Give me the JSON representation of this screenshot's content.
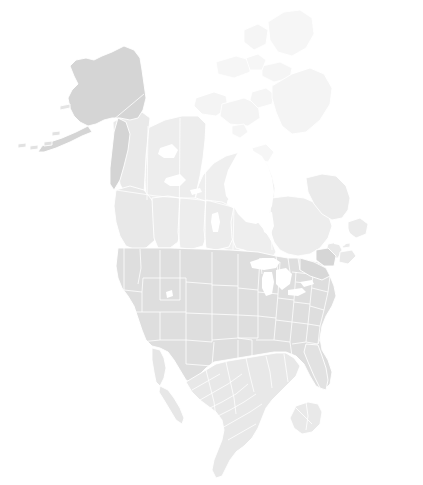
{
  "map": {
    "title": "North America",
    "projection": "albers-north-america",
    "background_color": "#ffffff",
    "border_color": "#ffffff",
    "water_color": "#ffffff",
    "width": 423,
    "height": 485,
    "legend_visible": false,
    "labels_visible": false,
    "countries": [
      {
        "name": "Canada",
        "fill": "#ececec",
        "subdivision_level": "province",
        "subdivisions": [
          {
            "name": "Yukon",
            "fill": "#e9e9e9"
          },
          {
            "name": "Northwest Territories",
            "fill": "#ededed"
          },
          {
            "name": "Nunavut",
            "fill": "#efefef"
          },
          {
            "name": "British Columbia",
            "fill": "#e8e8e8"
          },
          {
            "name": "Alberta",
            "fill": "#ebebeb"
          },
          {
            "name": "Saskatchewan",
            "fill": "#ededed"
          },
          {
            "name": "Manitoba",
            "fill": "#ececec"
          },
          {
            "name": "Ontario",
            "fill": "#eeeeee"
          },
          {
            "name": "Quebec",
            "fill": "#ededed"
          },
          {
            "name": "Newfoundland and Labrador",
            "fill": "#ebebeb"
          },
          {
            "name": "New Brunswick",
            "fill": "#e9e9e9"
          },
          {
            "name": "Nova Scotia",
            "fill": "#e9e9e9"
          },
          {
            "name": "Prince Edward Island",
            "fill": "#eaeaea"
          }
        ]
      },
      {
        "name": "United States",
        "fill": "#e3e3e3",
        "subdivision_level": "state",
        "subdivisions": [
          {
            "name": "Alaska",
            "fill": "#d5d5d5"
          },
          {
            "name": "Washington",
            "fill": "#dddddd"
          },
          {
            "name": "Oregon",
            "fill": "#dedede"
          },
          {
            "name": "California",
            "fill": "#dfdfdf"
          },
          {
            "name": "Idaho",
            "fill": "#dcdcdc"
          },
          {
            "name": "Nevada",
            "fill": "#e0e0e0"
          },
          {
            "name": "Montana",
            "fill": "#dbdbdb"
          },
          {
            "name": "Wyoming",
            "fill": "#dddddd"
          },
          {
            "name": "Utah",
            "fill": "#e0e0e0"
          },
          {
            "name": "Arizona",
            "fill": "#e1e1e1"
          },
          {
            "name": "Colorado",
            "fill": "#dedede"
          },
          {
            "name": "New Mexico",
            "fill": "#e1e1e1"
          },
          {
            "name": "North Dakota",
            "fill": "#dadada"
          },
          {
            "name": "South Dakota",
            "fill": "#dcdcdc"
          },
          {
            "name": "Nebraska",
            "fill": "#dedede"
          },
          {
            "name": "Kansas",
            "fill": "#e0e0e0"
          },
          {
            "name": "Oklahoma",
            "fill": "#e1e1e1"
          },
          {
            "name": "Texas",
            "fill": "#e2e2e2"
          },
          {
            "name": "Minnesota",
            "fill": "#dcdcdc"
          },
          {
            "name": "Iowa",
            "fill": "#dedede"
          },
          {
            "name": "Missouri",
            "fill": "#e0e0e0"
          },
          {
            "name": "Arkansas",
            "fill": "#e2e2e2"
          },
          {
            "name": "Louisiana",
            "fill": "#e3e3e3"
          },
          {
            "name": "Wisconsin",
            "fill": "#dcdcdc"
          },
          {
            "name": "Illinois",
            "fill": "#dfdfdf"
          },
          {
            "name": "Michigan",
            "fill": "#dbdbdb"
          },
          {
            "name": "Indiana",
            "fill": "#dedede"
          },
          {
            "name": "Ohio",
            "fill": "#dddddd"
          },
          {
            "name": "Kentucky",
            "fill": "#e0e0e0"
          },
          {
            "name": "Tennessee",
            "fill": "#e1e1e1"
          },
          {
            "name": "Mississippi",
            "fill": "#e3e3e3"
          },
          {
            "name": "Alabama",
            "fill": "#e2e2e2"
          },
          {
            "name": "Georgia",
            "fill": "#e1e1e1"
          },
          {
            "name": "Florida",
            "fill": "#e2e2e2"
          },
          {
            "name": "South Carolina",
            "fill": "#e0e0e0"
          },
          {
            "name": "North Carolina",
            "fill": "#dedede"
          },
          {
            "name": "Virginia",
            "fill": "#dcdcdc"
          },
          {
            "name": "West Virginia",
            "fill": "#dddddd"
          },
          {
            "name": "Pennsylvania",
            "fill": "#d9d9d9"
          },
          {
            "name": "New York",
            "fill": "#d7d7d7"
          },
          {
            "name": "Vermont",
            "fill": "#d8d8d8"
          },
          {
            "name": "New Hampshire",
            "fill": "#d8d8d8"
          },
          {
            "name": "Maine",
            "fill": "#d6d6d6"
          },
          {
            "name": "Massachusetts",
            "fill": "#d7d7d7"
          },
          {
            "name": "Connecticut",
            "fill": "#d8d8d8"
          },
          {
            "name": "Rhode Island",
            "fill": "#d8d8d8"
          },
          {
            "name": "New Jersey",
            "fill": "#d8d8d8"
          },
          {
            "name": "Delaware",
            "fill": "#d9d9d9"
          },
          {
            "name": "Maryland",
            "fill": "#d9d9d9"
          }
        ]
      },
      {
        "name": "Mexico",
        "fill": "#e8e8e8",
        "subdivision_level": "state",
        "subdivisions": [
          {
            "name": "Baja California",
            "fill": "#e6e6e6"
          },
          {
            "name": "Baja California Sur",
            "fill": "#e7e7e7"
          },
          {
            "name": "Sonora",
            "fill": "#e6e6e6"
          },
          {
            "name": "Chihuahua",
            "fill": "#e7e7e7"
          },
          {
            "name": "Coahuila",
            "fill": "#e8e8e8"
          },
          {
            "name": "Nuevo Leon",
            "fill": "#e8e8e8"
          },
          {
            "name": "Tamaulipas",
            "fill": "#e9e9e9"
          },
          {
            "name": "Sinaloa",
            "fill": "#e7e7e7"
          },
          {
            "name": "Durango",
            "fill": "#e8e8e8"
          },
          {
            "name": "Zacatecas",
            "fill": "#e8e8e8"
          },
          {
            "name": "Jalisco",
            "fill": "#e9e9e9"
          },
          {
            "name": "Michoacan",
            "fill": "#e9e9e9"
          },
          {
            "name": "Guerrero",
            "fill": "#eaeaea"
          },
          {
            "name": "Oaxaca",
            "fill": "#eaeaea"
          },
          {
            "name": "Veracruz",
            "fill": "#e9e9e9"
          },
          {
            "name": "Chiapas",
            "fill": "#ebebeb"
          },
          {
            "name": "Yucatan",
            "fill": "#e9e9e9"
          },
          {
            "name": "Quintana Roo",
            "fill": "#eaeaea"
          },
          {
            "name": "Campeche",
            "fill": "#eaeaea"
          },
          {
            "name": "Tabasco",
            "fill": "#ebebeb"
          }
        ]
      }
    ],
    "water_bodies": [
      {
        "name": "Hudson Bay"
      },
      {
        "name": "Lake Superior"
      },
      {
        "name": "Lake Michigan"
      },
      {
        "name": "Lake Huron"
      },
      {
        "name": "Lake Erie"
      },
      {
        "name": "Lake Ontario"
      },
      {
        "name": "Great Bear Lake"
      },
      {
        "name": "Great Slave Lake"
      },
      {
        "name": "Lake Winnipeg"
      },
      {
        "name": "Gulf of Mexico"
      },
      {
        "name": "Pacific Ocean"
      },
      {
        "name": "Atlantic Ocean"
      },
      {
        "name": "Arctic Ocean"
      }
    ]
  }
}
